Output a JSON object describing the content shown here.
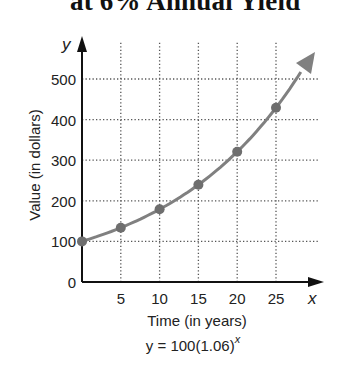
{
  "title": "at 6% Annual Yield",
  "chart_data": {
    "type": "line",
    "title": "at 6% Annual Yield",
    "xlabel": "Time (in years)",
    "ylabel": "Value (in dollars)",
    "x_axis_var": "x",
    "y_axis_var": "y",
    "equation": "y = 100(1.06)^x",
    "equation_base": "y = 100(1.06)",
    "equation_exponent": "x",
    "x_ticks": [
      "5",
      "10",
      "15",
      "20",
      "25"
    ],
    "y_ticks": [
      "0",
      "100",
      "200",
      "300",
      "400",
      "500"
    ],
    "xlim": [
      0,
      30
    ],
    "ylim": [
      0,
      530
    ],
    "grid": true,
    "grid_style": "dotted",
    "series": [
      {
        "name": "y = 100(1.06)^x",
        "x": [
          0,
          5,
          10,
          15,
          20,
          25
        ],
        "values": [
          100,
          133.8,
          179.1,
          239.7,
          320.7,
          429.2
        ],
        "color": "#808080",
        "marker_color": "#6e6e6e",
        "continues_with_arrow": true
      }
    ]
  }
}
